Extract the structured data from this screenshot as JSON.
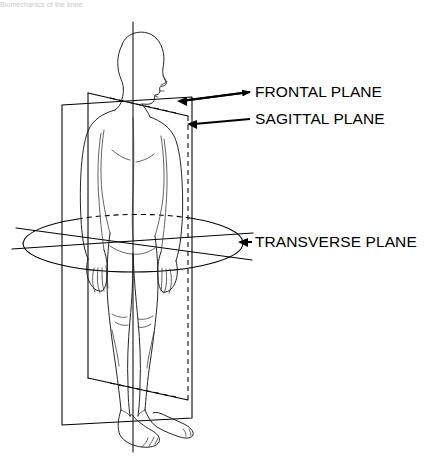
{
  "figure": {
    "title_caption": "Biomechanics of the knee",
    "view": "posterior standing human figure with three anatomical reference planes",
    "background_color": "#ffffff",
    "line_color": "#000000",
    "label_color": "#000000"
  },
  "labels": {
    "frontal": {
      "text": "FRONTAL PLANE",
      "x": 255,
      "y": 97,
      "arrow_from_x": 250,
      "arrow_from_y": 92,
      "arrow_to_x": 178,
      "arrow_to_y": 101
    },
    "sagittal": {
      "text": "SAGITTAL PLANE",
      "x": 255,
      "y": 124,
      "arrow_from_x": 250,
      "arrow_from_y": 119,
      "arrow_to_x": 188,
      "arrow_to_y": 124
    },
    "transverse": {
      "text": "TRANSVERSE PLANE",
      "x": 255,
      "y": 246,
      "arrow_from_x": 250,
      "arrow_from_y": 242,
      "arrow_to_x": 239,
      "arrow_to_y": 242
    }
  },
  "planes": {
    "frontal": {
      "name": "frontal-plane",
      "shape": "parallelogram",
      "corners": [
        [
          62,
          105
        ],
        [
          192,
          97
        ],
        [
          192,
          418
        ],
        [
          62,
          425
        ]
      ],
      "orientation": "vertical, divides front from back"
    },
    "sagittal": {
      "name": "sagittal-plane",
      "shape": "parallelogram-in-perspective",
      "corners": [
        [
          88,
          93
        ],
        [
          188,
          116
        ],
        [
          188,
          400
        ],
        [
          88,
          378
        ]
      ],
      "orientation": "vertical, divides left from right",
      "hidden_edges_dashed": true
    },
    "transverse": {
      "name": "transverse-plane",
      "shape": "ellipse",
      "center_x": 133,
      "center_y": 243,
      "radius_x": 110,
      "radius_y": 29,
      "orientation": "horizontal, divides upper from lower",
      "hidden_arc_dashed": true
    }
  },
  "axis": {
    "vertical_axis": {
      "x": 133,
      "y_top": 22,
      "y_bottom": 452
    },
    "frontal_trace": {
      "x1": 12,
      "y1": 249,
      "x2": 253,
      "y2": 233
    },
    "sagittal_trace": {
      "x1": 16,
      "y1": 228,
      "x2": 252,
      "y2": 260
    }
  }
}
